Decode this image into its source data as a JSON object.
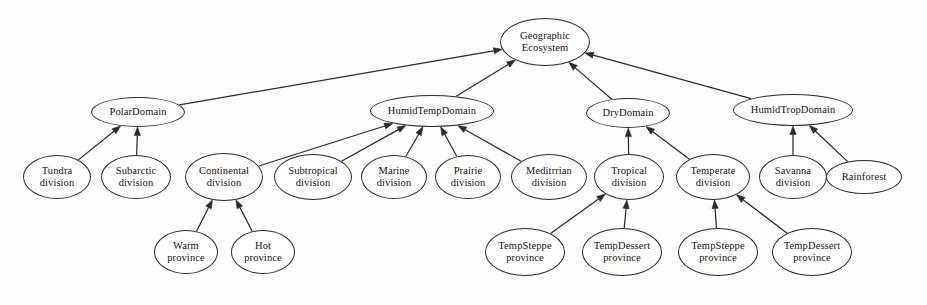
{
  "diagram": {
    "type": "uml-generalization-tree",
    "background_color": "#fdfdfc",
    "stroke_color": "#2b2b2b",
    "text_color": "#14110f",
    "arrow_style": "solid-filled-triangle",
    "arrow_direction": "child-to-parent",
    "nodes": [
      {
        "id": "root",
        "label": "Geographic\nEcosystem",
        "level": "root",
        "cx": 545,
        "cy": 42,
        "rx": 45,
        "ry": 24
      },
      {
        "id": "polar",
        "label": "PolarDomain",
        "level": "domain",
        "cx": 138,
        "cy": 112,
        "rx": 47,
        "ry": 15
      },
      {
        "id": "humidtemp",
        "label": "HumidTempDomain",
        "level": "domain",
        "cx": 432,
        "cy": 111,
        "rx": 62,
        "ry": 16
      },
      {
        "id": "dry",
        "label": "DryDomain",
        "level": "domain",
        "cx": 628,
        "cy": 113,
        "rx": 42,
        "ry": 15
      },
      {
        "id": "humidtrop",
        "label": "HumidTropDomain",
        "level": "domain",
        "cx": 793,
        "cy": 110,
        "rx": 60,
        "ry": 16
      },
      {
        "id": "tundra",
        "label": "Tundra\ndivision",
        "level": "division",
        "cx": 57,
        "cy": 177,
        "rx": 34,
        "ry": 22
      },
      {
        "id": "subarctic",
        "label": "Subarctic\ndivision",
        "level": "division",
        "cx": 136,
        "cy": 177,
        "rx": 35,
        "ry": 22
      },
      {
        "id": "continental",
        "label": "Continental\ndivision",
        "level": "division",
        "cx": 224,
        "cy": 177,
        "rx": 39,
        "ry": 24
      },
      {
        "id": "subtropical",
        "label": "Subtropical\ndivision",
        "level": "division",
        "cx": 313,
        "cy": 177,
        "rx": 39,
        "ry": 23
      },
      {
        "id": "marine",
        "label": "Marine\ndivision",
        "level": "division",
        "cx": 394,
        "cy": 177,
        "rx": 33,
        "ry": 22
      },
      {
        "id": "prairie",
        "label": "Prairie\ndivision",
        "level": "division",
        "cx": 468,
        "cy": 177,
        "rx": 33,
        "ry": 22
      },
      {
        "id": "meditrrian",
        "label": "Meditrrian\ndivision",
        "level": "division",
        "cx": 549,
        "cy": 177,
        "rx": 38,
        "ry": 23
      },
      {
        "id": "tropical",
        "label": "Tropical\ndivision",
        "level": "division",
        "cx": 629,
        "cy": 177,
        "rx": 35,
        "ry": 23
      },
      {
        "id": "temperate",
        "label": "Temperate\ndivision",
        "level": "division",
        "cx": 713,
        "cy": 177,
        "rx": 37,
        "ry": 23
      },
      {
        "id": "savanna",
        "label": "Savanna\ndivision",
        "level": "division",
        "cx": 793,
        "cy": 177,
        "rx": 34,
        "ry": 22
      },
      {
        "id": "rainforest",
        "label": "Rainforest",
        "level": "division",
        "cx": 864,
        "cy": 177,
        "rx": 38,
        "ry": 17
      },
      {
        "id": "warm",
        "label": "Warm\nprovince",
        "level": "province",
        "cx": 186,
        "cy": 252,
        "rx": 32,
        "ry": 22
      },
      {
        "id": "hot",
        "label": "Hot\nprovince",
        "level": "province",
        "cx": 263,
        "cy": 252,
        "rx": 32,
        "ry": 22
      },
      {
        "id": "tempsteppe1",
        "label": "TempSteppe\nprovince",
        "level": "province",
        "cx": 525,
        "cy": 252,
        "rx": 40,
        "ry": 24
      },
      {
        "id": "tempdessert1",
        "label": "TempDessert\nprovince",
        "level": "province",
        "cx": 622,
        "cy": 252,
        "rx": 40,
        "ry": 24
      },
      {
        "id": "tempsteppe2",
        "label": "TempSteppe\nprovince",
        "level": "province",
        "cx": 718,
        "cy": 252,
        "rx": 40,
        "ry": 24
      },
      {
        "id": "tempdessert2",
        "label": "TempDessert\nprovince",
        "level": "province",
        "cx": 812,
        "cy": 252,
        "rx": 40,
        "ry": 24
      }
    ],
    "edges": [
      {
        "from": "polar",
        "to": "root"
      },
      {
        "from": "humidtemp",
        "to": "root"
      },
      {
        "from": "dry",
        "to": "root"
      },
      {
        "from": "humidtrop",
        "to": "root"
      },
      {
        "from": "tundra",
        "to": "polar"
      },
      {
        "from": "subarctic",
        "to": "polar"
      },
      {
        "from": "continental",
        "to": "humidtemp"
      },
      {
        "from": "subtropical",
        "to": "humidtemp"
      },
      {
        "from": "marine",
        "to": "humidtemp"
      },
      {
        "from": "prairie",
        "to": "humidtemp"
      },
      {
        "from": "meditrrian",
        "to": "humidtemp"
      },
      {
        "from": "tropical",
        "to": "dry"
      },
      {
        "from": "temperate",
        "to": "dry"
      },
      {
        "from": "savanna",
        "to": "humidtrop"
      },
      {
        "from": "rainforest",
        "to": "humidtrop"
      },
      {
        "from": "warm",
        "to": "continental"
      },
      {
        "from": "hot",
        "to": "continental"
      },
      {
        "from": "tempsteppe1",
        "to": "tropical"
      },
      {
        "from": "tempdessert1",
        "to": "tropical"
      },
      {
        "from": "tempsteppe2",
        "to": "temperate"
      },
      {
        "from": "tempdessert2",
        "to": "temperate"
      }
    ]
  }
}
